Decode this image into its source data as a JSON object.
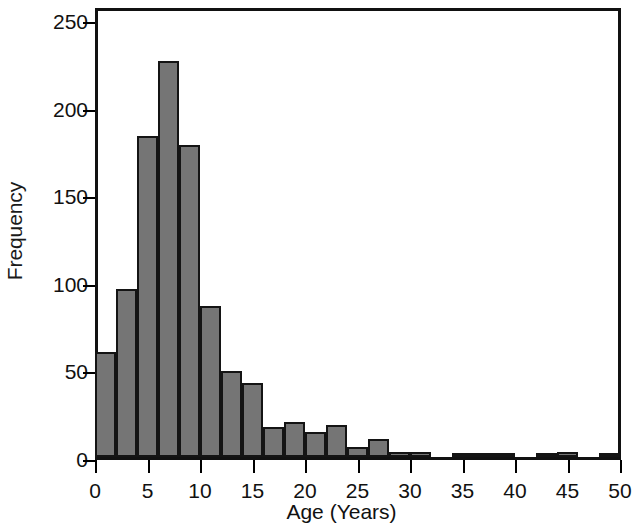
{
  "chart_data": {
    "type": "bar",
    "title": "",
    "subtitle": "",
    "xlabel": "Age (Years)",
    "ylabel": "Frequency",
    "xlim": [
      0,
      50
    ],
    "ylim": [
      0,
      250
    ],
    "grid": false,
    "legend": null,
    "bin_width": 2,
    "xticks": [
      0,
      5,
      10,
      15,
      20,
      25,
      30,
      35,
      40,
      45,
      50
    ],
    "xtick_labels": [
      "0",
      "5",
      "10",
      "15",
      "20",
      "25",
      "30",
      "35",
      "40",
      "45",
      "50"
    ],
    "yticks": [
      0,
      50,
      100,
      150,
      200,
      250
    ],
    "ytick_labels": [
      "0",
      "50",
      "100",
      "150",
      "200",
      "250"
    ],
    "bar_color": "#757575",
    "bar_edge_color": "#141414",
    "bins": [
      {
        "x0": 0,
        "x1": 2,
        "value": 60
      },
      {
        "x0": 2,
        "x1": 4,
        "value": 96
      },
      {
        "x0": 4,
        "x1": 6,
        "value": 183
      },
      {
        "x0": 6,
        "x1": 8,
        "value": 226
      },
      {
        "x0": 8,
        "x1": 10,
        "value": 178
      },
      {
        "x0": 10,
        "x1": 12,
        "value": 86
      },
      {
        "x0": 12,
        "x1": 14,
        "value": 49
      },
      {
        "x0": 14,
        "x1": 16,
        "value": 42
      },
      {
        "x0": 16,
        "x1": 18,
        "value": 17
      },
      {
        "x0": 18,
        "x1": 20,
        "value": 20
      },
      {
        "x0": 20,
        "x1": 22,
        "value": 14
      },
      {
        "x0": 22,
        "x1": 24,
        "value": 18
      },
      {
        "x0": 24,
        "x1": 26,
        "value": 6
      },
      {
        "x0": 26,
        "x1": 28,
        "value": 10
      },
      {
        "x0": 28,
        "x1": 30,
        "value": 3
      },
      {
        "x0": 30,
        "x1": 32,
        "value": 3
      },
      {
        "x0": 32,
        "x1": 34,
        "value": 0
      },
      {
        "x0": 34,
        "x1": 36,
        "value": 2
      },
      {
        "x0": 36,
        "x1": 38,
        "value": 2
      },
      {
        "x0": 38,
        "x1": 40,
        "value": 2
      },
      {
        "x0": 40,
        "x1": 42,
        "value": 0
      },
      {
        "x0": 42,
        "x1": 44,
        "value": 2
      },
      {
        "x0": 44,
        "x1": 46,
        "value": 3
      },
      {
        "x0": 46,
        "x1": 48,
        "value": 0
      },
      {
        "x0": 48,
        "x1": 50,
        "value": 2
      }
    ]
  }
}
